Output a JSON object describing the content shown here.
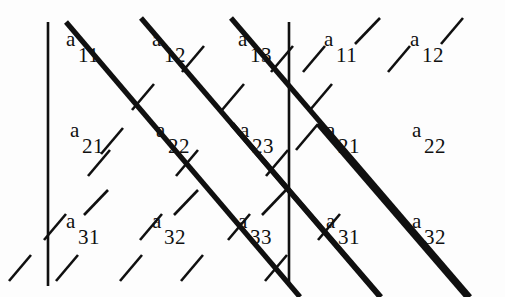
{
  "figure": {
    "kind": "matrix-expansion-diagram",
    "title": "",
    "background_color": "#fdfdfd",
    "ink_color": "#101010",
    "width": 505,
    "height": 297
  },
  "matrix": {
    "base_symbol": "a",
    "rows": 3,
    "columns": 5,
    "entries": [
      {
        "base": "a",
        "sub": "11",
        "x": 66,
        "y": 29
      },
      {
        "base": "a",
        "sub": "12",
        "x": 152,
        "y": 29
      },
      {
        "base": "a",
        "sub": "13",
        "x": 238,
        "y": 29
      },
      {
        "base": "a",
        "sub": "11",
        "x": 324,
        "y": 29
      },
      {
        "base": "a",
        "sub": "12",
        "x": 410,
        "y": 29
      },
      {
        "base": "a",
        "sub": "21",
        "x": 70,
        "y": 120
      },
      {
        "base": "a",
        "sub": "22",
        "x": 156,
        "y": 120
      },
      {
        "base": "a",
        "sub": "23",
        "x": 240,
        "y": 120
      },
      {
        "base": "a",
        "sub": "21",
        "x": 326,
        "y": 120
      },
      {
        "base": "a",
        "sub": "22",
        "x": 412,
        "y": 120
      },
      {
        "base": "a",
        "sub": "31",
        "x": 66,
        "y": 211
      },
      {
        "base": "a",
        "sub": "32",
        "x": 152,
        "y": 211
      },
      {
        "base": "a",
        "sub": "33",
        "x": 238,
        "y": 211
      },
      {
        "base": "a",
        "sub": "31",
        "x": 326,
        "y": 211
      },
      {
        "base": "a",
        "sub": "32",
        "x": 412,
        "y": 211
      }
    ]
  },
  "vertical_bars": [
    {
      "label": "left-determinant-bar",
      "x": 48,
      "y1": 22,
      "y2": 286,
      "width": 2.6
    },
    {
      "label": "right-determinant-bar",
      "x": 289,
      "y1": 22,
      "y2": 286,
      "width": 2.6
    }
  ],
  "thick_diagonals": {
    "label": "positive-term-diagonals",
    "direction": "down-right",
    "stroke_width": 5.2,
    "lines": [
      {
        "x1": 66,
        "y1": 22,
        "x2": 300,
        "y2": 297
      },
      {
        "x1": 141,
        "y1": 18,
        "x2": 380,
        "y2": 297
      },
      {
        "x1": 231,
        "y1": 18,
        "x2": 470,
        "y2": 297
      },
      {
        "x1": 318,
        "y1": 124,
        "x2": 467,
        "y2": 297
      },
      {
        "x1": 232,
        "y1": 124,
        "x2": 381,
        "y2": 297
      }
    ]
  },
  "thin_diagonals": {
    "label": "negative-term-dashed-diagonals",
    "direction": "up-right",
    "stroke_width": 2.6,
    "dash_segments": [
      {
        "x1": 9,
        "y1": 281,
        "x2": 31,
        "y2": 255
      },
      {
        "x1": 56,
        "y1": 281,
        "x2": 78,
        "y2": 255
      },
      {
        "x1": 120,
        "y1": 281,
        "x2": 142,
        "y2": 255
      },
      {
        "x1": 181,
        "y1": 281,
        "x2": 203,
        "y2": 255
      },
      {
        "x1": 265,
        "y1": 281,
        "x2": 287,
        "y2": 255
      },
      {
        "x1": 44,
        "y1": 240,
        "x2": 66,
        "y2": 214
      },
      {
        "x1": 140,
        "y1": 240,
        "x2": 162,
        "y2": 214
      },
      {
        "x1": 228,
        "y1": 240,
        "x2": 250,
        "y2": 214
      },
      {
        "x1": 318,
        "y1": 240,
        "x2": 340,
        "y2": 214
      },
      {
        "x1": 84,
        "y1": 215,
        "x2": 108,
        "y2": 190
      },
      {
        "x1": 174,
        "y1": 215,
        "x2": 198,
        "y2": 190
      },
      {
        "x1": 262,
        "y1": 215,
        "x2": 286,
        "y2": 190
      },
      {
        "x1": 88,
        "y1": 176,
        "x2": 110,
        "y2": 150
      },
      {
        "x1": 176,
        "y1": 176,
        "x2": 198,
        "y2": 150
      },
      {
        "x1": 266,
        "y1": 176,
        "x2": 288,
        "y2": 150
      },
      {
        "x1": 296,
        "y1": 150,
        "x2": 318,
        "y2": 124
      },
      {
        "x1": 101,
        "y1": 154,
        "x2": 123,
        "y2": 128
      },
      {
        "x1": 132,
        "y1": 110,
        "x2": 154,
        "y2": 84
      },
      {
        "x1": 222,
        "y1": 110,
        "x2": 244,
        "y2": 84
      },
      {
        "x1": 310,
        "y1": 110,
        "x2": 332,
        "y2": 84
      },
      {
        "x1": 182,
        "y1": 72,
        "x2": 204,
        "y2": 46
      },
      {
        "x1": 271,
        "y1": 72,
        "x2": 293,
        "y2": 46
      },
      {
        "x1": 303,
        "y1": 72,
        "x2": 325,
        "y2": 46
      },
      {
        "x1": 388,
        "y1": 72,
        "x2": 410,
        "y2": 46
      },
      {
        "x1": 355,
        "y1": 44,
        "x2": 380,
        "y2": 18
      },
      {
        "x1": 441,
        "y1": 44,
        "x2": 463,
        "y2": 18
      }
    ]
  }
}
